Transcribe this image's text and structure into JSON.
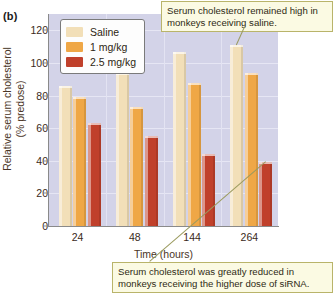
{
  "panel": {
    "letter": "(b)"
  },
  "chart_data": {
    "type": "bar",
    "title": "",
    "xlabel": "Time (hours)",
    "ylabel": "Relative serum cholesterol (% predose)",
    "ylabel_line1": "Relative serum cholesterol",
    "ylabel_line2": "(% predose)",
    "categories": [
      "24",
      "48",
      "144",
      "264"
    ],
    "yticks": [
      0,
      20,
      40,
      60,
      80,
      100,
      120
    ],
    "ylim": [
      0,
      130
    ],
    "grid": true,
    "legend_position": "top-left",
    "series": [
      {
        "name": "Saline",
        "color": "#f2dfb8",
        "values": [
          86,
          94,
          107,
          111
        ]
      },
      {
        "name": "1 mg/kg",
        "color": "#efa746",
        "values": [
          79,
          73,
          88,
          94
        ]
      },
      {
        "name": "2.5 mg/kg",
        "color": "#c0402b",
        "values": [
          63,
          55,
          44,
          39
        ]
      }
    ],
    "annotations": [
      {
        "text": "Serum cholesterol remained high in monkeys receiving saline.",
        "points_to": "Saline bar at 264 hours"
      },
      {
        "text": "Serum cholesterol was greatly reduced in monkeys receiving the higher dose of siRNA.",
        "points_to": "2.5 mg/kg bar at 264 hours"
      }
    ]
  },
  "colors": {
    "plot_background": "#d3d3e8",
    "saline": "#f2dfb8",
    "dose_1mg": "#efa746",
    "dose_2_5mg": "#c0402b",
    "callout_background": "#fbfae3",
    "callout_border": "#b9b46a"
  }
}
